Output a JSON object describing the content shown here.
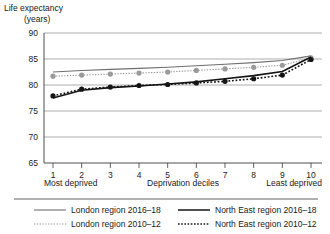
{
  "chart_data": {
    "type": "line",
    "title": "Life expectancy",
    "subtitle": "(years)",
    "ylabel": "Life expectancy (years)",
    "xlabel": "Deprivation deciles",
    "xlabel_left": "Most deprived",
    "xlabel_right": "Least deprived",
    "grid": true,
    "legend_position": "bottom",
    "ylim": [
      65,
      90
    ],
    "yticks": [
      65,
      70,
      75,
      80,
      85,
      90
    ],
    "categories": [
      1,
      2,
      3,
      4,
      5,
      6,
      7,
      8,
      9,
      10
    ],
    "xticklabels": [
      "1",
      "2",
      "3",
      "4",
      "5",
      "6",
      "7",
      "8",
      "9",
      "10"
    ],
    "series": [
      {
        "name": "London region 2016–18",
        "style": "solid",
        "color": "#6e6e6e",
        "markers": false,
        "values": [
          82.5,
          82.8,
          83.0,
          83.2,
          83.4,
          83.7,
          84.0,
          84.3,
          84.7,
          85.6
        ]
      },
      {
        "name": "London region 2010–12",
        "style": "dotted",
        "color": "#9a9a9a",
        "markers": true,
        "values": [
          81.7,
          81.9,
          82.1,
          82.3,
          82.5,
          82.8,
          83.1,
          83.4,
          83.8,
          85.2
        ]
      },
      {
        "name": "North East region 2016–18",
        "style": "solid",
        "color": "#141414",
        "markers": false,
        "values": [
          77.5,
          79.0,
          79.5,
          79.8,
          80.2,
          80.6,
          81.2,
          81.8,
          82.6,
          85.4
        ]
      },
      {
        "name": "North East region 2010–12",
        "style": "dotted",
        "color": "#141414",
        "markers": true,
        "values": [
          77.9,
          79.2,
          79.6,
          79.9,
          80.1,
          80.4,
          80.7,
          81.2,
          81.9,
          84.9
        ]
      }
    ]
  },
  "legend": {
    "entries": [
      {
        "label": "London region 2016–18"
      },
      {
        "label": "North East region 2016–18"
      },
      {
        "label": "London region 2010–12"
      },
      {
        "label": "North East region 2010–12"
      }
    ]
  }
}
